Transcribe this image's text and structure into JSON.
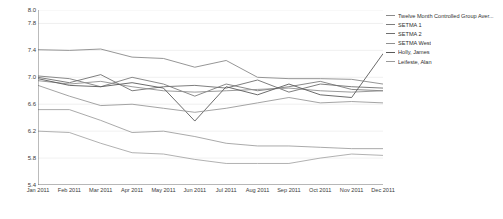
{
  "chart_data": {
    "type": "line",
    "title": "",
    "xlabel": "",
    "ylabel": "Average Value",
    "ylim": [
      5.4,
      8.0
    ],
    "yticks": [
      8.0,
      7.8,
      7.4,
      7.0,
      6.6,
      6.2,
      5.8,
      5.4
    ],
    "ytick_labels": [
      "8.0",
      "7.8",
      "7.4",
      "7.0",
      "6.6",
      "6.2",
      "5.8",
      "5.4"
    ],
    "grid": true,
    "legend_position": "right",
    "categories": [
      "Jan 2011",
      "Feb 2011",
      "Mar 2011",
      "Apr 2011",
      "May 2011",
      "Jun 2011",
      "Jul 2011",
      "Aug 2011",
      "Sep 2011",
      "Oct 2011",
      "Nov 2011",
      "Dec 2011"
    ],
    "series": [
      {
        "name": "Twelve Month Controlled Group Aver...",
        "color": "#8a8a8a",
        "values": [
          7.41,
          7.4,
          7.42,
          7.3,
          7.28,
          7.15,
          7.25,
          7.0,
          6.98,
          6.98,
          6.97,
          6.9
        ]
      },
      {
        "name": "SETMA 1",
        "color": "#7d7d7d",
        "values": [
          7.02,
          6.98,
          6.86,
          7.0,
          6.9,
          6.72,
          6.9,
          6.8,
          6.86,
          6.94,
          6.82,
          6.8
        ]
      },
      {
        "name": "SETMA 2",
        "color": "#6f6f6f",
        "values": [
          7.0,
          6.92,
          7.04,
          6.8,
          6.86,
          6.88,
          6.84,
          6.96,
          6.78,
          6.9,
          6.86,
          6.84
        ]
      },
      {
        "name": "SETMA West",
        "color": "#909090",
        "values": [
          6.95,
          6.9,
          6.94,
          6.86,
          6.8,
          6.78,
          6.8,
          6.82,
          6.84,
          6.8,
          6.78,
          6.8
        ]
      },
      {
        "name": "Holly, James",
        "color": "#5a5a5a",
        "values": [
          6.98,
          6.88,
          6.86,
          6.92,
          6.84,
          6.35,
          6.86,
          6.74,
          6.9,
          6.74,
          6.7,
          7.35
        ]
      },
      {
        "name": "Leifeste, Alan",
        "color": "#9a9a9a",
        "values": [
          6.88,
          6.72,
          6.58,
          6.6,
          6.54,
          6.48,
          6.54,
          6.62,
          6.7,
          6.62,
          6.64,
          6.62
        ]
      },
      {
        "name": "series-lower-a",
        "color": "#a0a0a0",
        "values": [
          6.52,
          6.52,
          6.36,
          6.18,
          6.2,
          6.12,
          6.02,
          5.98,
          5.98,
          5.96,
          5.94,
          5.94
        ]
      },
      {
        "name": "series-lower-b",
        "color": "#a8a8a8",
        "values": [
          6.2,
          6.18,
          6.02,
          5.88,
          5.86,
          5.78,
          5.72,
          5.72,
          5.72,
          5.8,
          5.86,
          5.84
        ]
      }
    ]
  },
  "legend": {
    "items": [
      {
        "label": "Twelve Month Controlled Group Aver...",
        "color": "#8a8a8a"
      },
      {
        "label": "SETMA 1",
        "color": "#7d7d7d"
      },
      {
        "label": "SETMA 2",
        "color": "#6f6f6f"
      },
      {
        "label": "SETMA West",
        "color": "#909090"
      },
      {
        "label": "Holly, James",
        "color": "#5a5a5a"
      },
      {
        "label": "Leifeste, Alan",
        "color": "#9a9a9a"
      }
    ]
  },
  "axis": {
    "y_title": "Average Value"
  }
}
